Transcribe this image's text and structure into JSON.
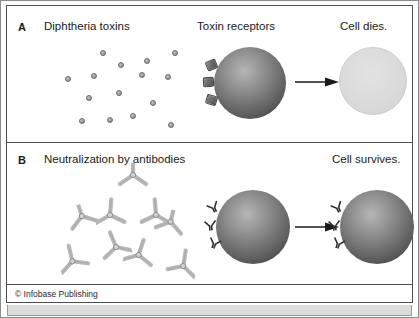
{
  "figure": {
    "credit": "© Infobase Publishing",
    "background_color": "#ffffff",
    "frame_color": "#4c5052"
  },
  "panels": [
    {
      "letter": "A",
      "title": "Diphtheria toxins",
      "stage_labels": [
        {
          "name": "toxin-receptors",
          "text": "Toxin receptors"
        },
        {
          "name": "outcome",
          "text": "Cell dies."
        }
      ],
      "toxin_count": 15,
      "toxin_color": "#9d9d9d",
      "cell_color": "#5f5f5f",
      "dead_cell_color": "#dadada",
      "receptor_count": 3,
      "receptor_state": "bound"
    },
    {
      "letter": "B",
      "title": "Neutralization by antibodies",
      "stage_labels": [
        {
          "name": "outcome",
          "text": "Cell survives."
        }
      ],
      "antibody_complex_count": 3,
      "antibody_color": "#b9b9b9",
      "cell_color": "#5f5f5f",
      "receptor_count": 3,
      "receptor_state": "free"
    }
  ],
  "toxin_positions": [
    {
      "x": 38,
      "y": 6
    },
    {
      "x": 110,
      "y": 6
    },
    {
      "x": 56,
      "y": 18
    },
    {
      "x": 29,
      "y": 29
    },
    {
      "x": 77,
      "y": 28
    },
    {
      "x": 103,
      "y": 30
    },
    {
      "x": 3,
      "y": 32
    },
    {
      "x": 54,
      "y": 46
    },
    {
      "x": 24,
      "y": 51
    },
    {
      "x": 88,
      "y": 56
    },
    {
      "x": 68,
      "y": 69
    },
    {
      "x": 17,
      "y": 74
    },
    {
      "x": 45,
      "y": 73
    },
    {
      "x": 106,
      "y": 78
    },
    {
      "x": 82,
      "y": 14
    }
  ],
  "antibody_complexes": [
    {
      "name": "complex-top",
      "x": 44,
      "y": 0,
      "rotation": 0
    },
    {
      "name": "complex-left",
      "x": 0,
      "y": 40,
      "rotation": -18
    },
    {
      "name": "complex-right",
      "x": 76,
      "y": 46,
      "rotation": 14
    }
  ]
}
